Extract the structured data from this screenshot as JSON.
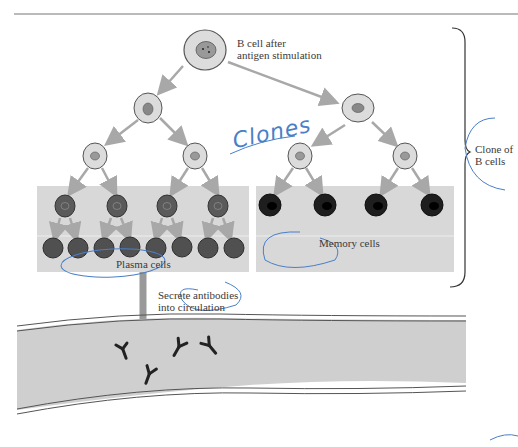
{
  "labels": {
    "b_cell_line1": "B cell after",
    "b_cell_line2": "antigen stimulation",
    "clones_handwritten": "Clones",
    "clone_of_line1": "Clone of",
    "clone_of_line2": "B cells",
    "memory_cells": "Memory cells",
    "plasma_cells": "Plasma cells",
    "secrete_line1": "Secrete antibodies",
    "secrete_line2": "into circulation"
  },
  "colors": {
    "panel_bg": "#d8d8d8",
    "cell_light": "#dcdcdc",
    "plasma_cell": "#555555",
    "memory_cell": "#1a1a1a",
    "arrow": "#a8a8a8",
    "vessel": "#cfcfcf",
    "annotation_ink": "#4a7fc8"
  }
}
